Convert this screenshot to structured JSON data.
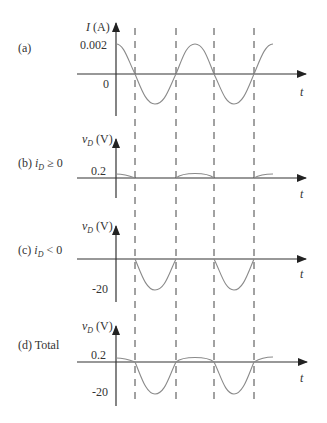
{
  "figure": {
    "background": "#ffffff",
    "axis_color": "#333333",
    "curve_color": "#8a8a8a",
    "time_axis_label": "t",
    "dashed_markers_x": [
      135,
      176,
      214,
      254
    ],
    "panels": [
      {
        "id": "a",
        "tag": "(a)",
        "tag_extra": "",
        "y_label_main": "I",
        "y_label_unit": " (A)",
        "y_label_sub": "",
        "ticks": [
          {
            "label": "0.002",
            "value": 0.002
          },
          {
            "label": "0",
            "value": 0
          }
        ],
        "description": "sinusoidal current, amplitude 0.002 A, starting at max"
      },
      {
        "id": "b",
        "tag": "(b) ",
        "tag_var": "i",
        "tag_sub": "D",
        "tag_cond": " ≥ 0",
        "y_label_main": "v",
        "y_label_sub": "D",
        "y_label_unit": " (V)",
        "ticks": [
          {
            "label": "0.2",
            "value": 0.2
          }
        ],
        "description": "diode voltage small positive bumps (0.2 V) during positive current half-cycles"
      },
      {
        "id": "c",
        "tag": "(c) ",
        "tag_var": "i",
        "tag_sub": "D",
        "tag_cond": " < 0",
        "y_label_main": "v",
        "y_label_sub": "D",
        "y_label_unit": " (V)",
        "ticks": [
          {
            "label": "-20",
            "value": -20
          }
        ],
        "description": "diode voltage negative half-sine (-20 V) during negative current half-cycles"
      },
      {
        "id": "d",
        "tag": "(d) Total",
        "y_label_main": "v",
        "y_label_sub": "D",
        "y_label_unit": " (V)",
        "ticks": [
          {
            "label": "0.2",
            "value": 0.2
          },
          {
            "label": "-20",
            "value": -20
          }
        ],
        "description": "total diode voltage: sum of (b) and (c)"
      }
    ]
  }
}
